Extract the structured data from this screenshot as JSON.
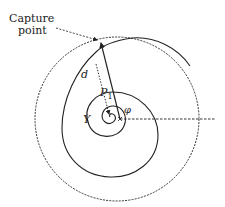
{
  "diagram": {
    "type": "geometric-schematic",
    "colors": {
      "stroke": "#222222",
      "background": "#ffffff"
    },
    "labels": {
      "capture_line1": "Capture",
      "capture_line2": "point",
      "d": "d",
      "p": "P",
      "p_sub": "1",
      "y": "Y",
      "phi": "φ"
    },
    "elements": [
      {
        "id": "outer-circle",
        "style": "dashed",
        "center": [
          117,
          119
        ],
        "radius": 82
      },
      {
        "id": "spiral-path",
        "style": "solid"
      },
      {
        "id": "position-vector-arrow",
        "style": "solid",
        "from": [
          120,
          119
        ],
        "to": [
          101,
          41
        ]
      },
      {
        "id": "distance-d-line",
        "style": "dotted"
      },
      {
        "id": "reference-axis",
        "style": "dashed",
        "from": [
          120,
          119
        ],
        "to": [
          215,
          119
        ]
      },
      {
        "id": "capture-pointer",
        "style": "dashed-arrow",
        "to": [
          99,
          40
        ]
      }
    ]
  }
}
